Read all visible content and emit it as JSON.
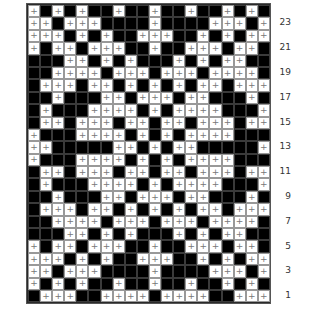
{
  "chart_title": "",
  "legend": {
    "plus_symbol": "+",
    "plus_color": "#ffffff",
    "filled_color": "#000000"
  },
  "grid": {
    "columns": 20,
    "rows_count": 24
  },
  "row_labels": [
    {
      "row": 23,
      "text": "23"
    },
    {
      "row": 21,
      "text": "21"
    },
    {
      "row": 19,
      "text": "19"
    },
    {
      "row": 17,
      "text": "17"
    },
    {
      "row": 15,
      "text": "15"
    },
    {
      "row": 13,
      "text": "13"
    },
    {
      "row": 11,
      "text": "11"
    },
    {
      "row": 9,
      "text": "9"
    },
    {
      "row": 7,
      "text": "7"
    },
    {
      "row": 5,
      "text": "5"
    },
    {
      "row": 3,
      "text": "3"
    },
    {
      "row": 1,
      "text": "1"
    }
  ],
  "rows": {
    "24": "+B+B+BB+BB+BB+BB+B+B",
    "23": "++B+++BBBB+BBBB+++B+",
    "22": "+++B+B+BB+++BB+B+B++",
    "21": "+B++B+++BB+BB+++B++B",
    "20": "BBB++B+B+BBB+B+B++BB",
    "19": "BB++++B+++B+++B++++B",
    "18": "B+++B++B+B+B+B++B+++",
    "17": "BB+BBB++B+++B++BBB+B",
    "16": "B+BBB++++B+B++++BBB+",
    "15": "B++B+++B++B++B+++B++",
    "14": "+BBB++++B+B+B++++BBB",
    "13": "++BBBBB++B+B++BBBBB+",
    "12": "+BBB++++B+B+B++++BBB",
    "11": "B++B+++B++B++B+++B++",
    "10": "B+BBB++++B+B++++BBB+",
    "9": "BB+BBB++B+++B++BBB+B",
    "8": "B+++B++B+B+B+B++B+++",
    "7": "BB++++B+++B+++B++++B",
    "6": "BBB++B+B+BBB+B+B++BB",
    "5": "+B++B+++BB+BB+++B++B",
    "4": "+++B+B+BB+++BB+B+B++",
    "3": "++B+++BBBB+BBBB+++B+",
    "2": "+B+B+BB+BB+BB+BB+B+B",
    "1": "B+++BB++++B++++BB+++"
  }
}
